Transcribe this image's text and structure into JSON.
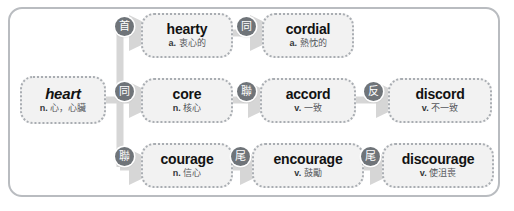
{
  "diagram": {
    "type": "word-family-tree",
    "root": "heart",
    "panel_border_color": "#b9bcc0",
    "node_fill_color": "#f2f2f2",
    "node_border_color": "#a9adb2",
    "badge_color": "#6f7479",
    "arrow_color": "#d9d9d9"
  },
  "nodes": {
    "heart": {
      "term": "heart",
      "pos": "n.",
      "gloss": "心，心臟"
    },
    "hearty": {
      "term": "hearty",
      "pos": "a.",
      "gloss": "衷心的"
    },
    "cordial": {
      "term": "cordial",
      "pos": "a.",
      "gloss": "熱忱的"
    },
    "core": {
      "term": "core",
      "pos": "n.",
      "gloss": "核心"
    },
    "accord": {
      "term": "accord",
      "pos": "v.",
      "gloss": "一致"
    },
    "discord": {
      "term": "discord",
      "pos": "v.",
      "gloss": "不一致"
    },
    "courage": {
      "term": "courage",
      "pos": "n.",
      "gloss": "信心"
    },
    "encourage": {
      "term": "encourage",
      "pos": "v.",
      "gloss": "鼓勵"
    },
    "discourage": {
      "term": "discourage",
      "pos": "v.",
      "gloss": "使沮喪"
    }
  },
  "badges": {
    "prefix_hearty": {
      "char": "首",
      "meaning": "prefix"
    },
    "syn_cordial": {
      "char": "同",
      "meaning": "synonym"
    },
    "syn_core": {
      "char": "同",
      "meaning": "synonym"
    },
    "link_accord": {
      "char": "聯",
      "meaning": "related"
    },
    "ant_discord": {
      "char": "反",
      "meaning": "antonym"
    },
    "link_courage": {
      "char": "聯",
      "meaning": "related"
    },
    "suffix_encourage": {
      "char": "尾",
      "meaning": "suffix"
    },
    "suffix_discourage": {
      "char": "尾",
      "meaning": "suffix"
    }
  }
}
